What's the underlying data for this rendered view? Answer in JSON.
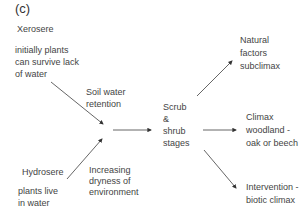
{
  "figure_label": "(c)",
  "xerosere": {
    "title": "Xerosere",
    "desc": [
      "initially plants",
      "can survive lack",
      "of water"
    ]
  },
  "soil_water": [
    "Soil water",
    "retention"
  ],
  "hydrosere": {
    "title": "Hydrosere",
    "desc": [
      "plants live",
      "in water"
    ]
  },
  "dryness": [
    "Increasing",
    "dryness of",
    "environment"
  ],
  "scrub": [
    "Scrub",
    "&",
    "shrub",
    "stages"
  ],
  "outcomes": {
    "natural": [
      "Natural",
      "factors",
      "subclimax"
    ],
    "climax": [
      "Climax",
      "woodland -",
      "oak or beech"
    ],
    "intervention": [
      "Intervention -",
      "biotic climax"
    ]
  },
  "colors": {
    "line": "#333333",
    "text": "#444444"
  }
}
